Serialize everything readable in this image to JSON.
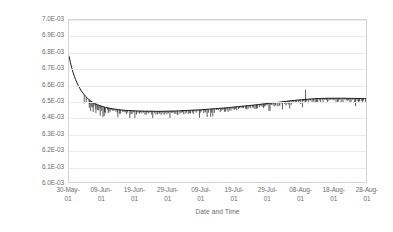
{
  "chart_data": {
    "type": "line",
    "title": "",
    "xlabel": "Date and Time",
    "ylabel": "Stern-Geary constant, V",
    "grid": "horizontal",
    "legend": "none",
    "ylim": [
      0.006,
      0.007
    ],
    "ytick_labels": [
      "7.0E-03",
      "6.9E-03",
      "6.8E-03",
      "6.7E-03",
      "6.6E-03",
      "6.5E-03",
      "6.4E-03",
      "6.3E-03",
      "6.2E-03",
      "6.1E-03",
      "6.0E-03"
    ],
    "ytick_values": [
      0.007,
      0.0069,
      0.0068,
      0.0067,
      0.0066,
      0.0065,
      0.0064,
      0.0063,
      0.0062,
      0.0061,
      0.006
    ],
    "xtick_labels": [
      {
        "line1": "30-May-",
        "line2": "01"
      },
      {
        "line1": "09-Jun-",
        "line2": "01"
      },
      {
        "line1": "19-Jun-",
        "line2": "01"
      },
      {
        "line1": "29-Jun-",
        "line2": "01"
      },
      {
        "line1": "09-Jul-",
        "line2": "01"
      },
      {
        "line1": "19-Jul-",
        "line2": "01"
      },
      {
        "line1": "29-Jul-",
        "line2": "01"
      },
      {
        "line1": "08-Aug-",
        "line2": "01"
      },
      {
        "line1": "18-Aug-",
        "line2": "01"
      },
      {
        "line1": "28-Aug-",
        "line2": "01"
      }
    ],
    "xlim_labels": [
      "30-May-01",
      "28-Aug-01"
    ],
    "series": [
      {
        "name": "Stern-Geary constant",
        "color": "#1a1a1a",
        "x": [
          0.0,
          0.4,
          0.8,
          1.2,
          1.6,
          2.0,
          2.4,
          2.8,
          3.2,
          3.6,
          4.0,
          4.5,
          5.0,
          5.5,
          6.0,
          6.5,
          7.0,
          7.5,
          8.0,
          8.5,
          9.0,
          9.5,
          10.0,
          11.0,
          12.0,
          13.0,
          14.0,
          15.0,
          16.0,
          17.0,
          18.0,
          19.0,
          20.0,
          21.0,
          22.0,
          23.0,
          24.0,
          25.0,
          26.0,
          27.0,
          28.0,
          29.0,
          30.0,
          31.0,
          32.0,
          33.0,
          34.0,
          35.0,
          36.0,
          37.0,
          38.0,
          39.0,
          40.0,
          41.0,
          42.0,
          43.0,
          44.0,
          45.0,
          46.0,
          47.0,
          48.0,
          49.0,
          50.0,
          51.0,
          52.0,
          53.0,
          54.0,
          55.0,
          56.0,
          57.0,
          58.0,
          59.0,
          60.0,
          61.0,
          62.0,
          63.0,
          64.0,
          65.0,
          66.0,
          67.0,
          68.0,
          69.0,
          70.0,
          71.0,
          72.0,
          73.0,
          74.0,
          75.0,
          76.0,
          77.0,
          78.0,
          79.0,
          80.0,
          81.0,
          82.0,
          83.0,
          84.0,
          85.0,
          86.0,
          87.0,
          88.0,
          89.0,
          90.0
        ],
        "y": [
          0.00678,
          0.006742,
          0.00671,
          0.006682,
          0.006657,
          0.006636,
          0.006617,
          0.0066,
          0.006585,
          0.006572,
          0.00656,
          0.006546,
          0.006534,
          0.006524,
          0.006515,
          0.006507,
          0.0065,
          0.006494,
          0.006489,
          0.006484,
          0.00648,
          0.006476,
          0.006473,
          0.006467,
          0.006463,
          0.006459,
          0.006456,
          0.006453,
          0.006451,
          0.006449,
          0.006448,
          0.006447,
          0.006446,
          0.006445,
          0.006445,
          0.006444,
          0.006444,
          0.006444,
          0.006443,
          0.006443,
          0.006443,
          0.006444,
          0.006444,
          0.006445,
          0.006445,
          0.006446,
          0.006447,
          0.006448,
          0.006449,
          0.00645,
          0.006451,
          0.006452,
          0.006453,
          0.006455,
          0.006456,
          0.006458,
          0.006459,
          0.006461,
          0.006462,
          0.006464,
          0.006466,
          0.006468,
          0.00647,
          0.006472,
          0.006474,
          0.006476,
          0.006478,
          0.00648,
          0.006482,
          0.006484,
          0.006487,
          0.006489,
          0.006491,
          0.006494,
          0.006496,
          0.006498,
          0.006501,
          0.006503,
          0.006506,
          0.006508,
          0.00651,
          0.006512,
          0.006514,
          0.006516,
          0.006517,
          0.006519,
          0.00652,
          0.006521,
          0.006522,
          0.006522,
          0.006523,
          0.006523,
          0.006523,
          0.006523,
          0.006523,
          0.006523,
          0.006522,
          0.006522,
          0.006522,
          0.006521,
          0.006521,
          0.006521,
          0.006521
        ],
        "noise_description": "dense short downward spikes along the flat portion, one tall upward spike near 08-Aug-01"
      }
    ]
  }
}
